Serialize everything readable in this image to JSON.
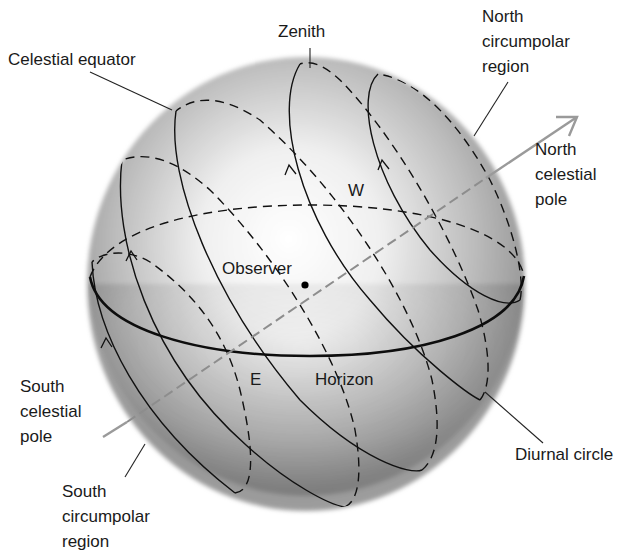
{
  "figure": {
    "labels": {
      "zenith": "Zenith",
      "celestial_equator": "Celestial equator",
      "north_circumpolar": [
        "North",
        "circumpolar",
        "region"
      ],
      "north_celestial_pole": [
        "North",
        "celestial",
        "pole"
      ],
      "west": "W",
      "observer": "Observer",
      "east": "E",
      "horizon": "Horizon",
      "south_celestial_pole": [
        "South",
        "celestial",
        "pole"
      ],
      "diurnal_circle": "Diurnal circle",
      "south_circumpolar": [
        "South",
        "circumpolar",
        "region"
      ]
    },
    "colors": {
      "sphere_light": "#ffffff",
      "sphere_dark": "#8c8c8c",
      "line": "#111111",
      "axis": "#9a9a9a"
    }
  }
}
